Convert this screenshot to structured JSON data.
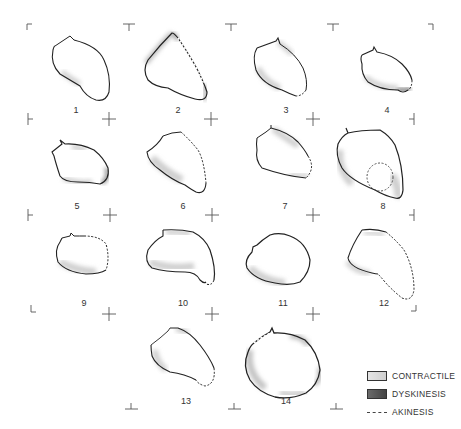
{
  "figure": {
    "panels": [
      {
        "label": "1",
        "x": 76,
        "y": 114
      },
      {
        "label": "2",
        "x": 178,
        "y": 114
      },
      {
        "label": "3",
        "x": 286,
        "y": 114
      },
      {
        "label": "4",
        "x": 387,
        "y": 114
      },
      {
        "label": "5",
        "x": 77,
        "y": 210
      },
      {
        "label": "6",
        "x": 183,
        "y": 210
      },
      {
        "label": "7",
        "x": 285,
        "y": 210
      },
      {
        "label": "8",
        "x": 383,
        "y": 210
      },
      {
        "label": "9",
        "x": 84,
        "y": 306
      },
      {
        "label": "10",
        "x": 183,
        "y": 306
      },
      {
        "label": "11",
        "x": 283,
        "y": 306
      },
      {
        "label": "12",
        "x": 384,
        "y": 306
      },
      {
        "label": "13",
        "x": 186,
        "y": 405
      },
      {
        "label": "14",
        "x": 286,
        "y": 405
      }
    ]
  },
  "legend": {
    "contractile": "CONTRACTILE",
    "dyskinesis": "DYSKINESIS",
    "akinesis": "AKINESIS"
  },
  "colors": {
    "outline": "#222222",
    "contractile_shade": "#d0d0d0",
    "dyskinesis_shade": "#555555",
    "background": "#ffffff"
  }
}
